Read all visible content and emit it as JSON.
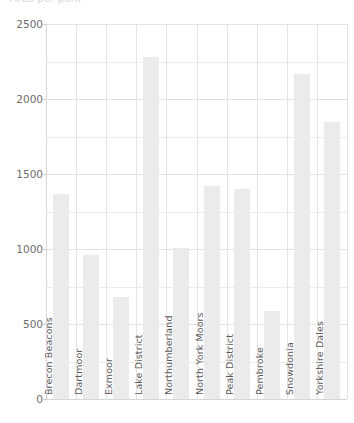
{
  "chart_data": {
    "type": "bar",
    "title": "Area per park",
    "xlabel": "",
    "ylabel": "",
    "categories": [
      "Brecon Beacons",
      "Dartmoor",
      "Exmoor",
      "Lake District",
      "Northumberland",
      "North York Moors",
      "Peak District",
      "Pembroke",
      "Snowdonia",
      "Yorkshire Dales"
    ],
    "values": [
      1370,
      960,
      680,
      2280,
      1010,
      1420,
      1400,
      590,
      2170,
      1850
    ],
    "ylim": [
      0,
      2500
    ],
    "yticks": [
      0,
      500,
      1000,
      1500,
      2000,
      2500
    ],
    "ytick_labels": [
      "0",
      "500",
      "1000",
      "1500",
      "2000",
      "2500"
    ],
    "minor_ytick_step": 250,
    "grid": true,
    "legend": false,
    "bar_color": "#ebebeb",
    "grid_color": "#e8e8e8",
    "axis_color": "#d6d6d6",
    "text_color": "#5a5a5a"
  }
}
